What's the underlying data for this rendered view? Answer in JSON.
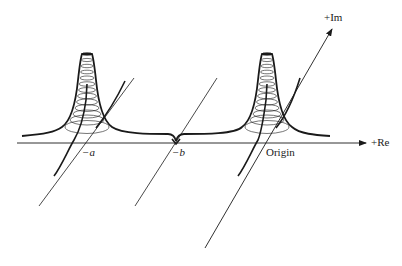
{
  "figure": {
    "colors": {
      "stroke": "#1a1a1a",
      "background": "#ffffff"
    }
  },
  "axes": {
    "real": {
      "label": "+Re"
    },
    "imaginary": {
      "label": "+Im"
    }
  },
  "points": [
    {
      "id": "minus-a",
      "label": "−a",
      "feature": "pole-peak"
    },
    {
      "id": "minus-b",
      "label": "−b",
      "feature": "zero-cusp"
    },
    {
      "id": "origin",
      "label": "Origin",
      "feature": "pole-peak"
    }
  ]
}
